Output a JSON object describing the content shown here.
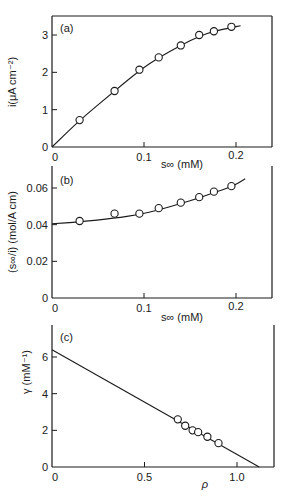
{
  "chart_data": [
    {
      "panel": "(a)",
      "type": "scatter",
      "fit": "curve",
      "xlabel": "s∞ (mM)",
      "ylabel": "i(μA cm⁻²)",
      "xticks": [
        "0",
        "0.1",
        "0.2"
      ],
      "yticks": [
        "0",
        "1",
        "2",
        "3"
      ],
      "xlim": [
        0,
        0.24
      ],
      "ylim": [
        0,
        3.5
      ],
      "x": [
        0.03,
        0.068,
        0.095,
        0.116,
        0.14,
        0.16,
        0.176,
        0.195
      ],
      "y": [
        0.72,
        1.5,
        2.07,
        2.4,
        2.72,
        3.0,
        3.1,
        3.22
      ],
      "fit_curve": {
        "x": [
          0,
          0.03,
          0.068,
          0.095,
          0.116,
          0.14,
          0.16,
          0.176,
          0.195,
          0.205
        ],
        "y": [
          0,
          0.72,
          1.5,
          2.05,
          2.4,
          2.72,
          2.97,
          3.1,
          3.2,
          3.25
        ]
      }
    },
    {
      "panel": "(b)",
      "type": "scatter",
      "fit": "curve",
      "xlabel": "s∞ (mM)",
      "ylabel": "(s∞/i) (mol/A cm)",
      "xticks": [
        "0",
        "0.1",
        "0.2"
      ],
      "yticks": [
        "0",
        "0.02",
        "0.04",
        "0.06"
      ],
      "xlim": [
        0,
        0.24
      ],
      "ylim": [
        0,
        0.07
      ],
      "x": [
        0.03,
        0.068,
        0.095,
        0.116,
        0.14,
        0.16,
        0.176,
        0.195
      ],
      "y": [
        0.042,
        0.046,
        0.046,
        0.049,
        0.052,
        0.055,
        0.058,
        0.061
      ],
      "fit_curve": {
        "x": [
          0,
          0.03,
          0.068,
          0.095,
          0.116,
          0.14,
          0.16,
          0.176,
          0.195,
          0.21
        ],
        "y": [
          0.0405,
          0.0415,
          0.0435,
          0.0455,
          0.048,
          0.0515,
          0.0545,
          0.0575,
          0.0605,
          0.065
        ]
      }
    },
    {
      "panel": "(c)",
      "type": "scatter",
      "fit": "line",
      "xlabel": "ρ",
      "ylabel": "γ (mM⁻¹)",
      "xticks": [
        "0",
        "0.5",
        "1.0"
      ],
      "yticks": [
        "0",
        "2",
        "4",
        "6"
      ],
      "xlim": [
        0,
        1.2
      ],
      "ylim": [
        0,
        7.5
      ],
      "x": [
        0.68,
        0.72,
        0.76,
        0.79,
        0.84,
        0.9
      ],
      "y": [
        2.6,
        2.25,
        2.0,
        1.9,
        1.65,
        1.3
      ],
      "fit_line": {
        "x": [
          0,
          1.12
        ],
        "y": [
          6.4,
          0
        ]
      }
    }
  ],
  "labels": {
    "panel_a": "(a)",
    "panel_b": "(b)",
    "panel_c": "(c)",
    "a_ylabel": "i(μA cm⁻²)",
    "b_ylabel": "(s∞/i) (mol/A cm)",
    "c_ylabel": "γ (mM⁻¹)",
    "a_xlabel": "s∞ (mM)",
    "b_xlabel": "s∞ (mM)",
    "c_xlabel": "ρ"
  }
}
